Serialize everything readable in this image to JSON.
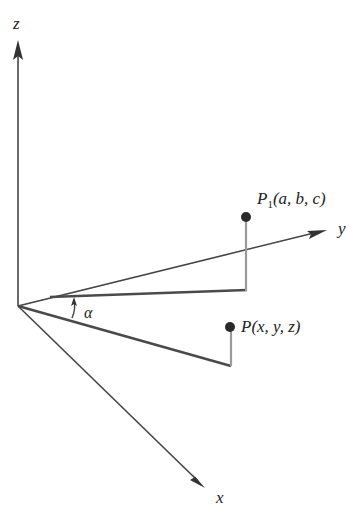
{
  "diagram": {
    "type": "3d-coordinate-rotation",
    "axes": {
      "z": {
        "label": "z"
      },
      "y": {
        "label": "y"
      },
      "x": {
        "label": "x"
      }
    },
    "points": {
      "p1": {
        "label_main": "P",
        "label_sub": "1",
        "label_coords": "(a, b, c)"
      },
      "p": {
        "label": "P(x, y, z)"
      }
    },
    "angle": {
      "label": "α"
    },
    "colors": {
      "axis": "#444444",
      "projection_dark": "#4a4a4a",
      "projection_light": "#9a9a9a",
      "point": "#2a2a2a",
      "background": "#ffffff"
    }
  }
}
